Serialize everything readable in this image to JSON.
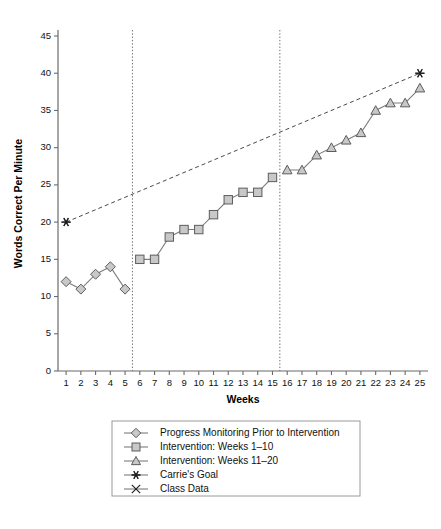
{
  "chart_data": {
    "type": "line",
    "title": "",
    "xlabel": "Weeks",
    "ylabel": "Words Correct Per Minute",
    "x": [
      1,
      2,
      3,
      4,
      5,
      6,
      7,
      8,
      9,
      10,
      11,
      12,
      13,
      14,
      15,
      16,
      17,
      18,
      19,
      20,
      21,
      22,
      23,
      24,
      25
    ],
    "xtick_labels": [
      "1",
      "2",
      "3",
      "4",
      "5",
      "6",
      "7",
      "8",
      "9",
      "10",
      "11",
      "12",
      "13",
      "14",
      "15",
      "16",
      "17",
      "18",
      "19",
      "20",
      "21",
      "22",
      "23",
      "24",
      "25"
    ],
    "xlim": [
      0.45,
      25.55
    ],
    "ylim": [
      0,
      45
    ],
    "ytick_labels": [
      "0",
      "5",
      "10",
      "15",
      "20",
      "25",
      "30",
      "35",
      "40",
      "45"
    ],
    "yticks": [
      0,
      5,
      10,
      15,
      20,
      25,
      30,
      35,
      40,
      45
    ],
    "grid": false,
    "legend_position": "below-center",
    "marker_fill": "#c8c8c8",
    "marker_stroke": "#5c5c5c",
    "line_color": "#7d7d7d",
    "series": [
      {
        "name": "Progress Monitoring Prior to Intervention",
        "marker": "diamond",
        "x": [
          1,
          2,
          3,
          4,
          5
        ],
        "values": [
          12,
          11,
          13,
          14,
          11
        ]
      },
      {
        "name": "Intervention: Weeks 1–10",
        "marker": "square",
        "x": [
          6,
          7,
          8,
          9,
          10,
          11,
          12,
          13,
          14,
          15
        ],
        "values": [
          15,
          15,
          18,
          19,
          19,
          21,
          23,
          24,
          24,
          26
        ]
      },
      {
        "name": "Intervention: Weeks 11–20",
        "marker": "triangle",
        "x": [
          16,
          17,
          18,
          19,
          20,
          21,
          22,
          23,
          24,
          25
        ],
        "values": [
          27,
          27,
          29,
          30,
          31,
          32,
          35,
          36,
          36,
          38
        ]
      },
      {
        "name": "Carrie's Goal",
        "marker": "star",
        "style": "dashed",
        "x": [
          1,
          25
        ],
        "values": [
          20,
          40
        ]
      },
      {
        "name": "Class Data",
        "marker": "x-cross",
        "x": [],
        "values": []
      }
    ],
    "phase_lines": [
      {
        "label": "phase-line-1",
        "x": 5.5
      },
      {
        "label": "phase-line-2",
        "x": 15.5
      }
    ],
    "annotations": []
  },
  "legend": {
    "items": [
      {
        "label": "Progress Monitoring Prior to Intervention",
        "marker": "diamond"
      },
      {
        "label": "Intervention: Weeks 1–10",
        "marker": "square"
      },
      {
        "label": "Intervention: Weeks 11–20",
        "marker": "triangle"
      },
      {
        "label": "Carrie's Goal",
        "marker": "star"
      },
      {
        "label": "Class Data",
        "marker": "x-cross"
      }
    ]
  }
}
